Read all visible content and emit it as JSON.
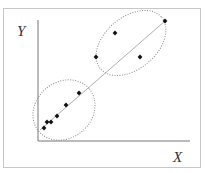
{
  "chart_data": {
    "type": "scatter",
    "title": "",
    "xlabel": "X",
    "ylabel": "Y",
    "grid": false,
    "legend": null,
    "points_px": [
      [
        44,
        128
      ],
      [
        47,
        122
      ],
      [
        51,
        122
      ],
      [
        57,
        116
      ],
      [
        66,
        105
      ],
      [
        79,
        93
      ],
      [
        96,
        57
      ],
      [
        115,
        33
      ],
      [
        140,
        57
      ],
      [
        165,
        21
      ]
    ],
    "points": [
      {
        "x": 0.04,
        "y": 0.1
      },
      {
        "x": 0.06,
        "y": 0.16
      },
      {
        "x": 0.09,
        "y": 0.16
      },
      {
        "x": 0.13,
        "y": 0.21
      },
      {
        "x": 0.18,
        "y": 0.31
      },
      {
        "x": 0.27,
        "y": 0.42
      },
      {
        "x": 0.38,
        "y": 0.76
      },
      {
        "x": 0.51,
        "y": 0.88
      },
      {
        "x": 0.67,
        "y": 0.66
      },
      {
        "x": 0.83,
        "y": 0.98
      }
    ],
    "fit_line": {
      "from_px": [
        40,
        130
      ],
      "to_px": [
        165,
        21
      ]
    },
    "clusters": [
      {
        "name": "lower-cluster",
        "cx": 64,
        "cy": 110,
        "rx": 33,
        "ry": 28,
        "rotate": -40
      },
      {
        "name": "upper-cluster",
        "cx": 131,
        "cy": 43,
        "rx": 40,
        "ry": 26,
        "rotate": -40
      }
    ],
    "colors": {
      "points": "#111111",
      "line": "#9a9a9a",
      "ellipse": "#8a8a8a",
      "axes": "#777777"
    }
  },
  "labels": {
    "x": "X",
    "y": "Y"
  }
}
